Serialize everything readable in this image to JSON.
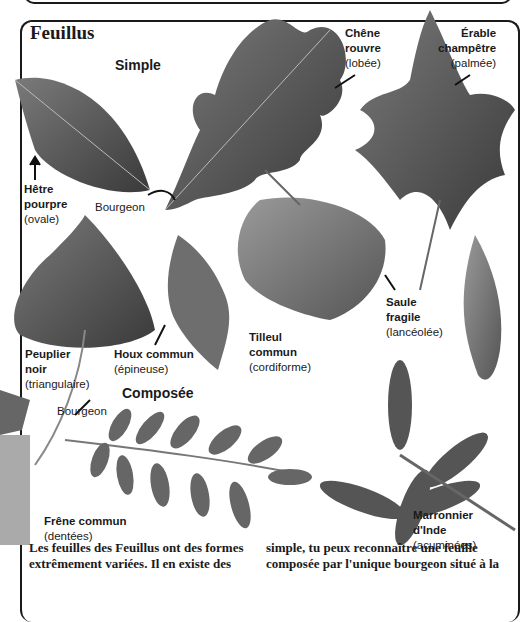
{
  "page": {
    "title": "Feuillus",
    "sections": {
      "simple": "Simple",
      "composee": "Composée"
    },
    "leaves": [
      {
        "name_line1": "Chêne",
        "name_line2": "rouvre",
        "shape": "(lobée)"
      },
      {
        "name_line1": "Érable",
        "name_line2": "champêtre",
        "shape": "(palmée)"
      },
      {
        "name_line1": "Hêtre",
        "name_line2": "pourpre",
        "shape": "(ovale)"
      },
      {
        "name_line1": "Peuplier",
        "name_line2": "noir",
        "shape": "(triangulaire)"
      },
      {
        "name_line1": "Houx commun",
        "name_line2": "",
        "shape": "(épineuse)"
      },
      {
        "name_line1": "Tilleul",
        "name_line2": "commun",
        "shape": "(cordiforme)"
      },
      {
        "name_line1": "Saule",
        "name_line2": "fragile",
        "shape": "(lancéolée)"
      },
      {
        "name_line1": "Frêne commun",
        "name_line2": "",
        "shape": "(dentées)"
      },
      {
        "name_line1": "Marronnier",
        "name_line2": "d'Inde",
        "shape": "(acuminées)"
      }
    ],
    "bud_labels": [
      "Bourgeon",
      "Bourgeon"
    ],
    "body_text": {
      "left_line1": "Les feuilles des Feuillus ont des formes",
      "left_line2": "extrêmement variées. Il en existe des",
      "right_line1": "simple, tu peux reconnaître une feuille",
      "right_line2": "composée par l'unique bourgeon situé à la"
    }
  }
}
